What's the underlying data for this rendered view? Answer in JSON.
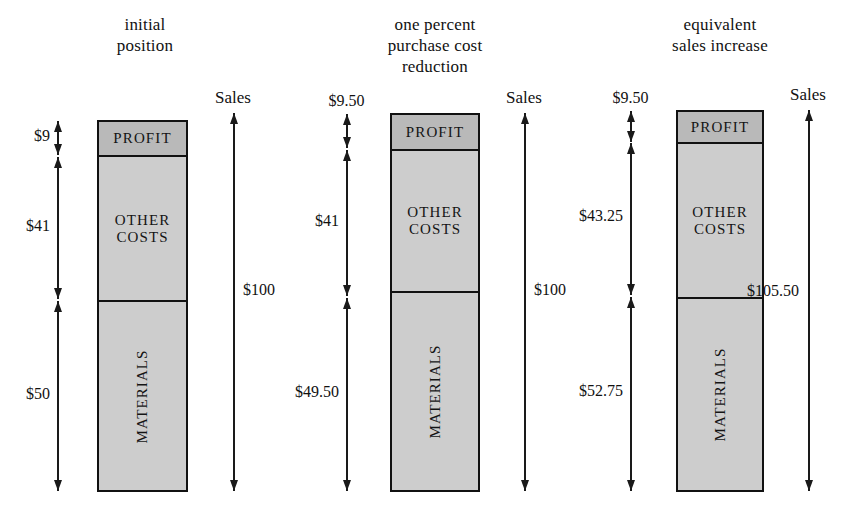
{
  "figure": {
    "type": "stacked-bar-diagram",
    "background": "#ffffff",
    "ink_color": "#111111",
    "profit_fill": "#b9b9b9",
    "cost_fill": "#cdcdcd",
    "sales_caption": "Sales"
  },
  "panels": [
    {
      "id": "initial-position",
      "title": "initial\nposition",
      "sales_caption": "Sales",
      "segments": [
        {
          "name": "profit",
          "label": "PROFIT",
          "value": 9,
          "orientation": "horizontal"
        },
        {
          "name": "other",
          "label": "OTHER\nCOSTS",
          "value": 41,
          "orientation": "horizontal"
        },
        {
          "name": "materials",
          "label": "MATERIALS",
          "value": 50,
          "orientation": "vertical"
        }
      ],
      "left_measures": [
        {
          "name": "profit-measure",
          "label": "$9",
          "value": 9
        },
        {
          "name": "other-measure",
          "label": "$41",
          "value": 41
        },
        {
          "name": "materials-measure",
          "label": "$50",
          "value": 50
        }
      ],
      "right_measure": {
        "name": "sales-measure",
        "label": "$100",
        "value": 100
      }
    },
    {
      "id": "one-percent-purchase-cost-reduction",
      "title": "one percent\npurchase cost\nreduction",
      "sales_caption": "Sales",
      "segments": [
        {
          "name": "profit",
          "label": "PROFIT",
          "value": 9.5,
          "orientation": "horizontal"
        },
        {
          "name": "other",
          "label": "OTHER\nCOSTS",
          "value": 41,
          "orientation": "horizontal"
        },
        {
          "name": "materials",
          "label": "MATERIALS",
          "value": 49.5,
          "orientation": "vertical"
        }
      ],
      "left_measures": [
        {
          "name": "profit-measure",
          "label": "$9.50",
          "value": 9.5
        },
        {
          "name": "other-measure",
          "label": "$41",
          "value": 41
        },
        {
          "name": "materials-measure",
          "label": "$49.50",
          "value": 49.5
        }
      ],
      "right_measure": {
        "name": "sales-measure",
        "label": "$100",
        "value": 100
      }
    },
    {
      "id": "equivalent-sales-increase",
      "title": "equivalent\nsales increase",
      "sales_caption": "Sales",
      "segments": [
        {
          "name": "profit",
          "label": "PROFIT",
          "value": 9.5,
          "orientation": "horizontal"
        },
        {
          "name": "other",
          "label": "OTHER\nCOSTS",
          "value": 43.25,
          "orientation": "horizontal"
        },
        {
          "name": "materials",
          "label": "MATERIALS",
          "value": 52.75,
          "orientation": "vertical"
        }
      ],
      "left_measures": [
        {
          "name": "profit-measure",
          "label": "$9.50",
          "value": 9.5
        },
        {
          "name": "other-measure",
          "label": "$43.25",
          "value": 43.25
        },
        {
          "name": "materials-measure",
          "label": "$52.75",
          "value": 52.75
        }
      ],
      "right_measure": {
        "name": "sales-measure",
        "label": "$105.50",
        "value": 105.5
      }
    }
  ]
}
